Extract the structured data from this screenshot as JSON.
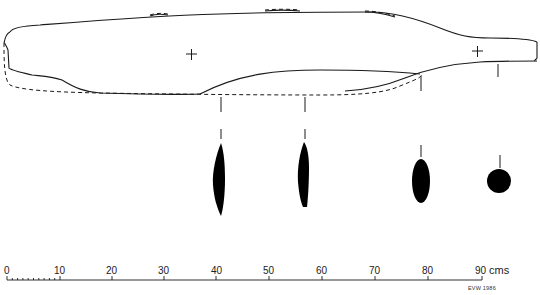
{
  "figure": {
    "colors": {
      "line": "#1a1a1a",
      "fill": "#000000",
      "background": "#ffffff"
    },
    "centre_marks": [
      {
        "icon": "cross-icon",
        "x": 191,
        "y": 54
      },
      {
        "icon": "cross-icon",
        "x": 477,
        "y": 51
      }
    ],
    "cross_sections": [
      {
        "id": "section-1",
        "position_cm": 41,
        "shape": "lenticular-elongated"
      },
      {
        "id": "section-2",
        "position_cm": 57,
        "shape": "lenticular-elongated"
      },
      {
        "id": "section-3",
        "position_cm": 79,
        "shape": "oval"
      },
      {
        "id": "section-4",
        "position_cm": 91,
        "shape": "circular"
      }
    ]
  },
  "scale_bar": {
    "ticks": [
      "0",
      "10",
      "20",
      "30",
      "40",
      "50",
      "60",
      "70",
      "80",
      "90"
    ],
    "unit": "cms",
    "minor_subdivisions_first_interval": 10
  },
  "credit": "EVW 1986"
}
